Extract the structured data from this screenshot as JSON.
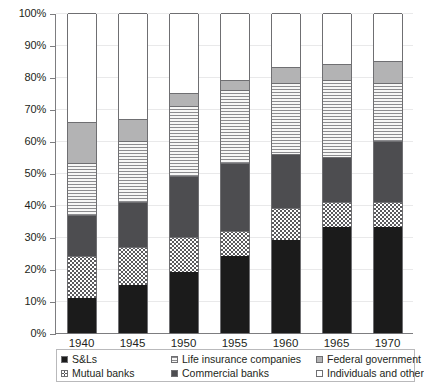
{
  "chart_data": {
    "type": "bar",
    "subtype": "stacked-percent",
    "title": "",
    "xlabel": "",
    "ylabel": "",
    "ylim": [
      0,
      100
    ],
    "ytick_labels": [
      "0%",
      "10%",
      "20%",
      "30%",
      "40%",
      "50%",
      "60%",
      "70%",
      "80%",
      "90%",
      "100%"
    ],
    "ytick_values": [
      0,
      10,
      20,
      30,
      40,
      50,
      60,
      70,
      80,
      90,
      100
    ],
    "grid": true,
    "legend_position": "bottom",
    "categories": [
      "1940",
      "1945",
      "1950",
      "1955",
      "1960",
      "1965",
      "1970"
    ],
    "series": [
      {
        "name": "S&Ls",
        "key": "sl",
        "color": "#1b1b1b",
        "pattern": "solid-black",
        "values": [
          11,
          15,
          19,
          24,
          29,
          33,
          33
        ]
      },
      {
        "name": "Mutual banks",
        "key": "mutual",
        "color": "#5a5a5d",
        "pattern": "checker",
        "values": [
          13,
          12,
          11,
          8,
          10,
          8,
          8
        ]
      },
      {
        "name": "Commercial banks",
        "key": "commercial",
        "color": "#4d4d50",
        "pattern": "solid-gray",
        "values": [
          13,
          14,
          19,
          21,
          17,
          14,
          19
        ]
      },
      {
        "name": "Life insurance companies",
        "key": "life",
        "color": "#8c8c8f",
        "pattern": "horizontal-lines",
        "values": [
          16,
          19,
          22,
          23,
          22,
          24,
          18
        ]
      },
      {
        "name": "Federal government",
        "key": "federal",
        "color": "#b3b3b4",
        "pattern": "solid-light",
        "values": [
          13,
          7,
          4,
          3,
          5,
          5,
          7
        ]
      },
      {
        "name": "Individuals and other",
        "key": "individuals",
        "color": "#ffffff",
        "pattern": "white",
        "values": [
          34,
          33,
          25,
          21,
          17,
          16,
          15
        ]
      }
    ],
    "cumulative_tops": {
      "1940": [
        11,
        24,
        37,
        53,
        66,
        100
      ],
      "1945": [
        15,
        27,
        41,
        60,
        67,
        100
      ],
      "1950": [
        19,
        30,
        49,
        71,
        75,
        100
      ],
      "1955": [
        24,
        32,
        53,
        76,
        79,
        100
      ],
      "1960": [
        29,
        39,
        56,
        78,
        83,
        100
      ],
      "1965": [
        33,
        41,
        55,
        79,
        84,
        100
      ],
      "1970": [
        33,
        41,
        60,
        78,
        85,
        100
      ]
    }
  },
  "legend": {
    "items": [
      {
        "label": "S&Ls",
        "swatch": "f-sl"
      },
      {
        "label": "Life insurance companies",
        "swatch": "f-life"
      },
      {
        "label": "Federal government",
        "swatch": "f-federal"
      },
      {
        "label": "Mutual banks",
        "swatch": "f-mutual"
      },
      {
        "label": "Commercial banks",
        "swatch": "f-commercial"
      },
      {
        "label": "Individuals and other",
        "swatch": "f-individuals"
      }
    ]
  }
}
